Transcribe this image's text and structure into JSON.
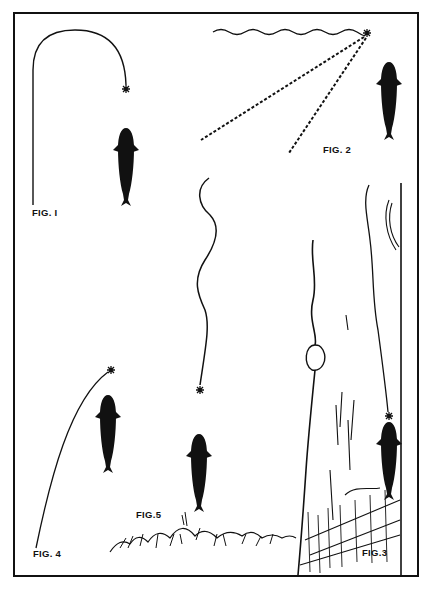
{
  "illustration": {
    "description": "Plate of fishing-fly presentation diagrams showing trout viewed from above",
    "colors": {
      "ink": "#111111",
      "paper": "#ffffff"
    },
    "figures": [
      {
        "id": "fig1",
        "label": "FIG. I",
        "content": "looped line ending in fly above a trout"
      },
      {
        "id": "fig2",
        "label": "FIG. 2",
        "content": "wavy surface line, fly, dotted sight lines, trout"
      },
      {
        "id": "fig3",
        "label": "FIG.3",
        "content": "stream bank with log, weeds, wavy line and trout"
      },
      {
        "id": "fig4",
        "label": "FIG. 4",
        "content": "curved line with fly upstream of trout"
      },
      {
        "id": "fig5",
        "label": "FIG.5",
        "content": "wavy line with fly above trout over weed bed"
      }
    ]
  }
}
